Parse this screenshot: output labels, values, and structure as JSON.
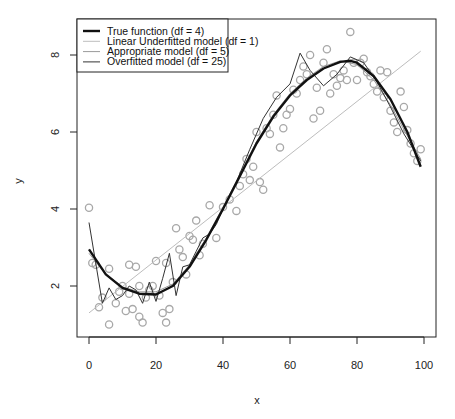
{
  "chart_data": {
    "type": "scatter",
    "title": "",
    "xlabel": "x",
    "ylabel": "y",
    "xlim": [
      -3.6,
      103.6
    ],
    "ylim": [
      0.9,
      8.9
    ],
    "grid": false,
    "legend_position": "topleft",
    "x_ticks": [
      0,
      20,
      40,
      60,
      80,
      100
    ],
    "x_tick_labels": [
      "0",
      "20",
      "40",
      "60",
      "80",
      "100"
    ],
    "y_ticks": [
      2,
      4,
      6,
      8
    ],
    "y_tick_labels": [
      "2",
      "4",
      "6",
      "8"
    ],
    "legend": [
      {
        "label": "True function (df = 4)",
        "color": "#111111",
        "width": 2.4
      },
      {
        "label": "Linear Underfitted model (df = 1)",
        "color": "#bdbdbd",
        "width": 1
      },
      {
        "label": "Appropriate model (df = 5)",
        "color": "#9a9a9a",
        "width": 1
      },
      {
        "label": "Overfitted model (df = 25)",
        "color": "#333333",
        "width": 1
      }
    ],
    "points_color": "#a8a8a8",
    "points": {
      "x": [
        0,
        1,
        2,
        3,
        4,
        6,
        6,
        8,
        9,
        10,
        11,
        12,
        12,
        13,
        14,
        15,
        15,
        16,
        17,
        18,
        19,
        20,
        21,
        22,
        23,
        23,
        24,
        25,
        26,
        27,
        28,
        29,
        30,
        31,
        32,
        33,
        34,
        36,
        38,
        40,
        42,
        44,
        45,
        46,
        47,
        48,
        49,
        50,
        51,
        52,
        53,
        54,
        55,
        56,
        57,
        58,
        59,
        60,
        61,
        62,
        63,
        64,
        65,
        66,
        67,
        68,
        69,
        70,
        71,
        72,
        73,
        74,
        75,
        76,
        77,
        78,
        79,
        80,
        81,
        82,
        83,
        84,
        85,
        86,
        87,
        88,
        89,
        90,
        91,
        92,
        93,
        94,
        95,
        96,
        97,
        98,
        99
      ],
      "y": [
        4.03,
        2.6,
        2.55,
        1.45,
        1.7,
        1.0,
        2.45,
        1.55,
        1.85,
        2.0,
        1.35,
        2.55,
        1.8,
        1.4,
        2.5,
        1.2,
        2.0,
        1.05,
        1.7,
        1.9,
        2.0,
        2.65,
        1.75,
        1.3,
        2.6,
        1.05,
        1.4,
        2.1,
        3.5,
        2.95,
        2.75,
        2.3,
        3.3,
        3.2,
        3.7,
        2.8,
        3.1,
        4.1,
        3.25,
        4.05,
        4.25,
        3.95,
        4.6,
        4.9,
        5.3,
        4.75,
        5.1,
        6.0,
        4.7,
        4.5,
        6.1,
        5.95,
        6.45,
        6.95,
        5.6,
        6.1,
        6.45,
        6.6,
        7.1,
        7.0,
        7.35,
        7.7,
        7.5,
        8.0,
        6.35,
        7.15,
        6.55,
        7.8,
        8.15,
        7.0,
        7.5,
        7.2,
        7.4,
        7.6,
        7.35,
        8.6,
        7.8,
        7.35,
        7.8,
        7.9,
        7.55,
        7.45,
        7.25,
        7.05,
        7.6,
        6.9,
        7.55,
        6.55,
        6.25,
        6.0,
        7.05,
        6.65,
        6.05,
        5.7,
        5.45,
        5.25,
        5.55
      ]
    },
    "series": [
      {
        "name": "True function (df = 4)",
        "x": [
          0,
          5,
          10,
          15,
          20,
          25,
          30,
          35,
          40,
          45,
          50,
          55,
          60,
          65,
          70,
          75,
          78,
          80,
          85,
          90,
          95,
          99
        ],
        "y": [
          2.95,
          2.3,
          1.95,
          1.8,
          1.78,
          2.0,
          2.5,
          3.2,
          4.0,
          4.85,
          5.7,
          6.4,
          6.95,
          7.35,
          7.65,
          7.82,
          7.85,
          7.8,
          7.45,
          6.85,
          6.0,
          5.1
        ]
      },
      {
        "name": "Linear Underfitted model (df = 1)",
        "x": [
          0,
          99
        ],
        "y": [
          1.3,
          8.1
        ]
      },
      {
        "name": "Appropriate model (df = 5)",
        "x": [
          0,
          5,
          10,
          15,
          20,
          25,
          30,
          35,
          40,
          45,
          50,
          55,
          60,
          65,
          70,
          75,
          80,
          85,
          90,
          95,
          99
        ],
        "y": [
          2.85,
          2.3,
          1.98,
          1.85,
          1.85,
          2.05,
          2.55,
          3.25,
          4.05,
          4.9,
          5.75,
          6.45,
          7.0,
          7.4,
          7.7,
          7.85,
          7.75,
          7.35,
          6.7,
          5.9,
          5.3
        ]
      },
      {
        "name": "Overfitted model (df = 25)",
        "x": [
          0,
          2,
          4,
          6,
          8,
          10,
          12,
          14,
          16,
          18,
          20,
          22,
          24,
          26,
          28,
          30,
          32,
          34,
          36,
          38,
          40,
          44,
          48,
          52,
          56,
          60,
          63,
          66,
          70,
          74,
          78,
          82,
          86,
          90,
          94,
          99
        ],
        "y": [
          3.65,
          2.6,
          1.55,
          1.95,
          1.65,
          1.75,
          2.0,
          1.9,
          1.55,
          2.1,
          1.6,
          2.2,
          2.85,
          1.75,
          2.5,
          2.55,
          2.9,
          3.25,
          3.35,
          3.6,
          4.0,
          4.7,
          5.55,
          6.35,
          6.9,
          7.25,
          8.05,
          7.6,
          7.2,
          7.5,
          7.95,
          7.8,
          7.3,
          6.65,
          5.95,
          5.25
        ]
      }
    ]
  }
}
